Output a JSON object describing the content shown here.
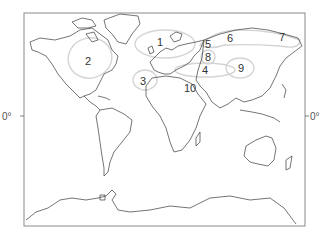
{
  "map": {
    "type": "world-outline",
    "frame": {
      "x": 24,
      "y": 13,
      "width": 281,
      "height": 213
    },
    "equator_labels": {
      "left": "0°",
      "right": "0°",
      "y": 116
    },
    "regions": [
      {
        "id": "1",
        "label": "1",
        "x": 161,
        "y": 42
      },
      {
        "id": "2",
        "label": "2",
        "x": 88,
        "y": 61
      },
      {
        "id": "3",
        "label": "3",
        "x": 143,
        "y": 81
      },
      {
        "id": "4",
        "label": "4",
        "x": 205,
        "y": 70
      },
      {
        "id": "5",
        "label": "5",
        "x": 208,
        "y": 44
      },
      {
        "id": "6",
        "label": "6",
        "x": 230,
        "y": 38
      },
      {
        "id": "7",
        "label": "7",
        "x": 282,
        "y": 37
      },
      {
        "id": "8",
        "label": "8",
        "x": 208,
        "y": 57
      },
      {
        "id": "9",
        "label": "9",
        "x": 241,
        "y": 68
      },
      {
        "id": "10",
        "label": "10",
        "x": 189,
        "y": 88
      }
    ],
    "colors": {
      "coastline": "#3a3a3a",
      "zone_outline": "#d4d4d4",
      "frame": "#8a8a8a",
      "background": "#ffffff"
    }
  }
}
